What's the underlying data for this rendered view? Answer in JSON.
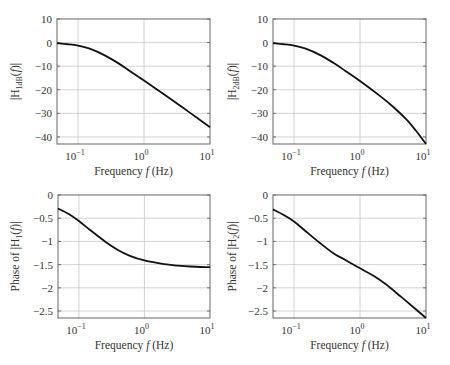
{
  "chart_data": [
    {
      "id": "mag1",
      "type": "line",
      "xscale": "log",
      "xlabel": "Frequency f (Hz)",
      "ylabel_main": "|H",
      "ylabel_sub": "1dB",
      "ylabel_tail": "(f)|",
      "xlim": [
        0.048,
        10
      ],
      "ylim": [
        -43,
        10
      ],
      "xticks": [
        0.1,
        1,
        10
      ],
      "xtick_labels": [
        "10",
        "10",
        "10"
      ],
      "xtick_exps": [
        "−1",
        "0",
        "1"
      ],
      "yticks": [
        10,
        0,
        -10,
        -20,
        -30,
        -40
      ],
      "ytick_labels": [
        "10",
        "0",
        "−10",
        "−20",
        "−30",
        "−40"
      ],
      "grid": true,
      "series": [
        {
          "name": "|H1dB(f)|",
          "x": [
            0.048,
            0.07,
            0.1,
            0.15,
            0.25,
            0.4,
            0.6,
            1,
            2,
            3.2,
            5,
            10
          ],
          "y": [
            -0.3,
            -0.7,
            -1.3,
            -2.6,
            -5.3,
            -8.6,
            -11.9,
            -16.1,
            -21.9,
            -25.9,
            -29.8,
            -35.9
          ]
        }
      ]
    },
    {
      "id": "mag2",
      "type": "line",
      "xscale": "log",
      "xlabel": "Frequency f (Hz)",
      "ylabel_main": "|H",
      "ylabel_sub": "2dB",
      "ylabel_tail": "(f)|",
      "xlim": [
        0.048,
        10
      ],
      "ylim": [
        -43,
        10
      ],
      "xticks": [
        0.1,
        1,
        10
      ],
      "xtick_labels": [
        "10",
        "10",
        "10"
      ],
      "xtick_exps": [
        "−1",
        "0",
        "1"
      ],
      "yticks": [
        10,
        0,
        -10,
        -20,
        -30,
        -40
      ],
      "ytick_labels": [
        "10",
        "0",
        "−10",
        "−20",
        "−30",
        "−40"
      ],
      "grid": true,
      "series": [
        {
          "name": "|H2dB(f)|",
          "x": [
            0.048,
            0.07,
            0.1,
            0.15,
            0.25,
            0.4,
            0.6,
            1,
            2,
            3.2,
            5,
            7,
            10
          ],
          "y": [
            -0.3,
            -0.7,
            -1.3,
            -2.6,
            -5.3,
            -8.7,
            -12.0,
            -16.3,
            -22.6,
            -27.3,
            -32.5,
            -37.3,
            -43.0
          ]
        }
      ]
    },
    {
      "id": "phase1",
      "type": "line",
      "xscale": "log",
      "xlabel": "Frequency f (Hz)",
      "ylabel_main": "Phase of |H",
      "ylabel_sub": "1",
      "ylabel_tail": "(f)|",
      "xlim": [
        0.048,
        10
      ],
      "ylim": [
        -2.65,
        0
      ],
      "xticks": [
        0.1,
        1,
        10
      ],
      "xtick_labels": [
        "10",
        "10",
        "10"
      ],
      "xtick_exps": [
        "−1",
        "0",
        "1"
      ],
      "yticks": [
        0,
        -0.5,
        -1,
        -1.5,
        -2,
        -2.5
      ],
      "ytick_labels": [
        "0",
        "−0.5",
        "−1",
        "−1.5",
        "−2",
        "−2.5"
      ],
      "grid": true,
      "series": [
        {
          "name": "Phase of |H1(f)|",
          "x": [
            0.048,
            0.07,
            0.1,
            0.15,
            0.25,
            0.4,
            0.6,
            1,
            2,
            3.2,
            5,
            10
          ],
          "y": [
            -0.29,
            -0.41,
            -0.56,
            -0.76,
            -1.0,
            -1.19,
            -1.31,
            -1.41,
            -1.49,
            -1.52,
            -1.54,
            -1.555
          ]
        }
      ]
    },
    {
      "id": "phase2",
      "type": "line",
      "xscale": "log",
      "xlabel": "Frequency f (Hz)",
      "ylabel_main": "Phase of |H",
      "ylabel_sub": "2",
      "ylabel_tail": "(f)|",
      "xlim": [
        0.048,
        10
      ],
      "ylim": [
        -2.65,
        0
      ],
      "xticks": [
        0.1,
        1,
        10
      ],
      "xtick_labels": [
        "10",
        "10",
        "10"
      ],
      "xtick_exps": [
        "−1",
        "0",
        "1"
      ],
      "yticks": [
        0,
        -0.5,
        -1,
        -1.5,
        -2,
        -2.5
      ],
      "ytick_labels": [
        "0",
        "−0.5",
        "−1",
        "−1.5",
        "−2",
        "−2.5"
      ],
      "grid": true,
      "series": [
        {
          "name": "Phase of |H2(f)|",
          "x": [
            0.048,
            0.07,
            0.1,
            0.15,
            0.25,
            0.4,
            0.6,
            1,
            1.6,
            2.5,
            4,
            6,
            10
          ],
          "y": [
            -0.31,
            -0.43,
            -0.57,
            -0.78,
            -1.04,
            -1.26,
            -1.4,
            -1.58,
            -1.74,
            -1.93,
            -2.17,
            -2.38,
            -2.65
          ]
        }
      ]
    }
  ]
}
